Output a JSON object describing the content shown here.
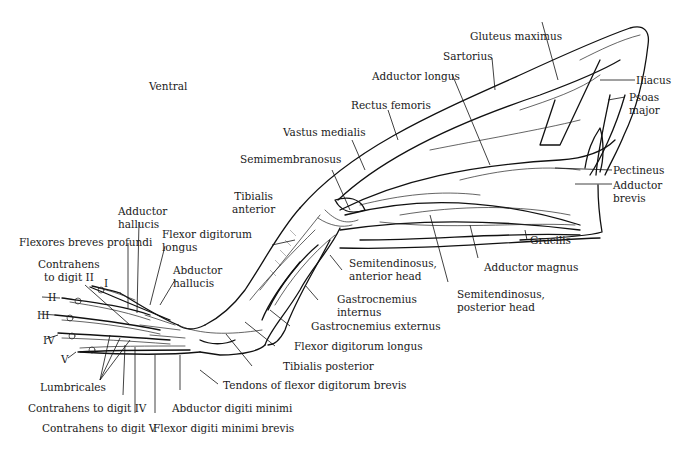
{
  "figure": {
    "orientation_label": "Ventral",
    "digits": [
      "I",
      "II",
      "III",
      "IV",
      "V"
    ],
    "labels": {
      "gluteus_maximus": "Gluteus maximus",
      "sartorius": "Sartorius",
      "adductor_longus": "Adductor longus",
      "iliacus": "Iliacus",
      "psoas_major": [
        "Psoas",
        "major"
      ],
      "rectus_femoris": "Rectus femoris",
      "vastus_medialis": "Vastus medialis",
      "semimembranosus": "Semimembranosus",
      "pectineus": "Pectineus",
      "adductor_brevis": [
        "Adductor",
        "brevis"
      ],
      "tibialis_anterior": [
        "Tibialis",
        "anterior"
      ],
      "adductor_hallucis": [
        "Adductor",
        "hallucis"
      ],
      "flexores_breves_profundi": "Flexores breves profundi",
      "flexor_digitorum_longus_upper": [
        "Flexor digitorum",
        "longus"
      ],
      "contrahens_digit_ii": [
        "Contrahens",
        "to digit II"
      ],
      "abductor_hallucis": [
        "Abductor",
        "hallucis"
      ],
      "gracilis": "Gracilis",
      "semitendinosus_anterior": [
        "Semitendinosus,",
        "anterior head"
      ],
      "adductor_magnus": "Adductor magnus",
      "gastrocnemius_internus": [
        "Gastrocnemius",
        "internus"
      ],
      "semitendinosus_posterior": [
        "Semitendinosus,",
        "posterior head"
      ],
      "gastrocnemius_externus": "Gastrocnemius externus",
      "flexor_digitorum_longus_lower": "Flexor digitorum longus",
      "tibialis_posterior": "Tibialis posterior",
      "tendons_flexor_digitorum_brevis": "Tendons of flexor digitorum brevis",
      "lumbricales": "Lumbricales",
      "contrahens_digit_iv": "Contrahens to digit IV",
      "abductor_digiti_minimi": "Abductor digiti minimi",
      "contrahens_digit_v": "Contrahens to digit V",
      "flexor_digiti_minimi_brevis": "Flexor digiti minimi brevis"
    }
  }
}
